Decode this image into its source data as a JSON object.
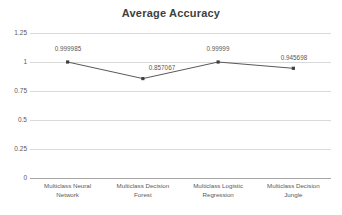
{
  "chart_data": {
    "type": "line",
    "title": "Average Accuracy",
    "xlabel": "",
    "ylabel": "",
    "categories": [
      "Multiclass Neural Network",
      "Multiclass Decision Forest",
      "Multiclass Logistic Regression",
      "Multiclass Decision Jungle"
    ],
    "category_lines": [
      [
        "Multiclass Neural",
        "Network"
      ],
      [
        "Multiclass Decision",
        "Forest"
      ],
      [
        "Multiclass Logistic",
        "Regression"
      ],
      [
        "Multiclass Decision",
        "Jungle"
      ]
    ],
    "values": [
      0.999985,
      0.857067,
      0.99999,
      0.945698
    ],
    "point_labels": [
      "0.999985",
      "0.857067",
      "0.99999",
      "0.945698"
    ],
    "ylim": [
      0,
      1.25
    ],
    "yticks": [
      0,
      0.25,
      0.5,
      0.75,
      1,
      1.25
    ],
    "ytick_labels": [
      "0",
      "0.25",
      "0.5",
      "0.75",
      "1",
      "1.25"
    ],
    "grid": true,
    "legend": false,
    "series": [
      {
        "name": "Average Accuracy",
        "values": [
          0.999985,
          0.857067,
          0.99999,
          0.945698
        ]
      }
    ],
    "colors": {
      "line": "#595959",
      "marker": "#404040",
      "grid": "#d9d9d9",
      "baseline": "#a6a6a6",
      "title": "#404040",
      "tick_text": "#595959",
      "background": "#ffffff"
    }
  }
}
